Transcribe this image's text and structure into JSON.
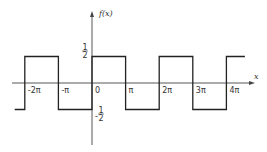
{
  "chart_data": {
    "type": "line",
    "title": "",
    "xlabel": "x",
    "ylabel": "f(x)",
    "xlim_pi": [
      -2.5,
      4.5
    ],
    "ylim": [
      -1,
      1
    ],
    "x_ticks": [
      {
        "value_pi": -2,
        "label": "-2π"
      },
      {
        "value_pi": -1,
        "label": "-π"
      },
      {
        "value_pi": 0,
        "label": "0"
      },
      {
        "value_pi": 1,
        "label": "π"
      },
      {
        "value_pi": 2,
        "label": "2π"
      },
      {
        "value_pi": 3,
        "label": "3π"
      },
      {
        "value_pi": 4,
        "label": "4π"
      }
    ],
    "y_ticks": [
      {
        "value": 0.5,
        "label_num": "1",
        "label_den": "2",
        "label_sign": ""
      },
      {
        "value": -0.5,
        "label_num": "1",
        "label_den": "2",
        "label_sign": "-"
      }
    ],
    "series": [
      {
        "name": "f(x)",
        "points_pi": [
          [
            -2.3,
            -0.5
          ],
          [
            -2,
            -0.5
          ],
          [
            -2,
            0.5
          ],
          [
            -1,
            0.5
          ],
          [
            -1,
            -0.5
          ],
          [
            0,
            -0.5
          ],
          [
            0,
            0.5
          ],
          [
            1,
            0.5
          ],
          [
            1,
            -0.5
          ],
          [
            2,
            -0.5
          ],
          [
            2,
            0.5
          ],
          [
            3,
            0.5
          ],
          [
            3,
            -0.5
          ],
          [
            4,
            -0.5
          ],
          [
            4,
            0.5
          ],
          [
            4.55,
            0.5
          ]
        ]
      }
    ],
    "grid": false,
    "legend": "none"
  }
}
